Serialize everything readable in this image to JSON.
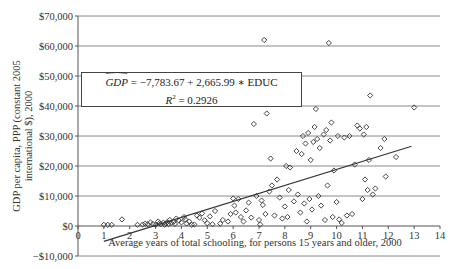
{
  "chart_data": {
    "type": "scatter",
    "title": "",
    "xlabel": "Average years of total schooling, for persons 15 years and older, 2000",
    "ylabel": "GDP per capita, PPP (constant 2005 international $), 2000",
    "xlim": [
      0,
      14
    ],
    "ylim": [
      -10000,
      70000
    ],
    "x_ticks": [
      0,
      1,
      2,
      3,
      4,
      5,
      6,
      7,
      8,
      9,
      10,
      11,
      12,
      13,
      14
    ],
    "y_ticks": [
      -10000,
      0,
      10000,
      20000,
      30000,
      40000,
      50000,
      60000,
      70000
    ],
    "y_tick_labels": [
      "−$10,000",
      "$0",
      "$10,000",
      "$20,000",
      "$30,000",
      "$40,000",
      "$50,000",
      "$60,000",
      "$70,000"
    ],
    "grid": "horizontal",
    "marker": "diamond-open",
    "regression": {
      "intercept": -7783.67,
      "slope": 2665.99,
      "variable": "EDUC",
      "r_squared": 0.2926,
      "x_range": [
        1.0,
        12.9
      ]
    },
    "annotation": {
      "lhs": "GDP",
      "equation_rhs": "= −7,783.67 + 2,665.99 ∗ EDUC",
      "r2_label": "R",
      "r2_value": "= 0.2926"
    },
    "points": [
      [
        1.0,
        400
      ],
      [
        1.15,
        400
      ],
      [
        1.3,
        400
      ],
      [
        1.7,
        2200
      ],
      [
        2.3,
        400
      ],
      [
        2.5,
        500
      ],
      [
        2.6,
        800
      ],
      [
        2.7,
        600
      ],
      [
        2.8,
        1200
      ],
      [
        2.9,
        700
      ],
      [
        3.0,
        400
      ],
      [
        3.1,
        1500
      ],
      [
        3.15,
        900
      ],
      [
        3.2,
        600
      ],
      [
        3.3,
        1100
      ],
      [
        3.35,
        400
      ],
      [
        3.4,
        800
      ],
      [
        3.45,
        1300
      ],
      [
        3.5,
        600
      ],
      [
        3.55,
        2000
      ],
      [
        3.6,
        1000
      ],
      [
        3.7,
        1400
      ],
      [
        3.75,
        700
      ],
      [
        3.8,
        2500
      ],
      [
        3.9,
        1800
      ],
      [
        4.0,
        1200
      ],
      [
        4.1,
        3000
      ],
      [
        4.15,
        2200
      ],
      [
        4.2,
        800
      ],
      [
        4.3,
        1500
      ],
      [
        4.4,
        400
      ],
      [
        4.5,
        500
      ],
      [
        4.6,
        3500
      ],
      [
        4.7,
        2800
      ],
      [
        4.8,
        4200
      ],
      [
        4.9,
        1900
      ],
      [
        5.0,
        900
      ],
      [
        5.1,
        3200
      ],
      [
        5.2,
        600
      ],
      [
        5.3,
        5000
      ],
      [
        5.5,
        800
      ],
      [
        5.6,
        2000
      ],
      [
        5.8,
        1500
      ],
      [
        5.9,
        4000
      ],
      [
        6.0,
        9200
      ],
      [
        6.05,
        6800
      ],
      [
        6.1,
        4500
      ],
      [
        6.2,
        9000
      ],
      [
        6.3,
        3000
      ],
      [
        6.4,
        1500
      ],
      [
        6.5,
        5200
      ],
      [
        6.6,
        7800
      ],
      [
        6.7,
        2800
      ],
      [
        6.8,
        34000
      ],
      [
        6.9,
        10000
      ],
      [
        7.0,
        2000
      ],
      [
        7.05,
        500
      ],
      [
        7.1,
        8500
      ],
      [
        7.15,
        7000
      ],
      [
        7.2,
        62000
      ],
      [
        7.25,
        4000
      ],
      [
        7.3,
        37500
      ],
      [
        7.4,
        11500
      ],
      [
        7.45,
        22500
      ],
      [
        7.5,
        13500
      ],
      [
        7.6,
        3500
      ],
      [
        7.7,
        15500
      ],
      [
        7.8,
        9500
      ],
      [
        7.9,
        2500
      ],
      [
        8.0,
        6500
      ],
      [
        8.05,
        20000
      ],
      [
        8.1,
        3000
      ],
      [
        8.15,
        12000
      ],
      [
        8.2,
        19500
      ],
      [
        8.3,
        48000
      ],
      [
        8.35,
        8200
      ],
      [
        8.4,
        46000
      ],
      [
        8.45,
        25000
      ],
      [
        8.5,
        10500
      ],
      [
        8.6,
        4500
      ],
      [
        8.65,
        24000
      ],
      [
        8.7,
        30000
      ],
      [
        8.75,
        7500
      ],
      [
        8.8,
        27500
      ],
      [
        8.85,
        1500
      ],
      [
        8.9,
        31000
      ],
      [
        8.95,
        9000
      ],
      [
        9.0,
        22000
      ],
      [
        9.05,
        5500
      ],
      [
        9.1,
        28000
      ],
      [
        9.15,
        33000
      ],
      [
        9.2,
        39000
      ],
      [
        9.25,
        29000
      ],
      [
        9.3,
        10000
      ],
      [
        9.35,
        26000
      ],
      [
        9.4,
        6800
      ],
      [
        9.5,
        30500
      ],
      [
        9.55,
        2000
      ],
      [
        9.6,
        32000
      ],
      [
        9.65,
        13500
      ],
      [
        9.7,
        61000
      ],
      [
        9.75,
        28500
      ],
      [
        9.8,
        34500
      ],
      [
        9.85,
        3000
      ],
      [
        9.9,
        18500
      ],
      [
        10.0,
        8000
      ],
      [
        10.05,
        30000
      ],
      [
        10.1,
        2200
      ],
      [
        10.2,
        1000
      ],
      [
        10.3,
        29500
      ],
      [
        10.4,
        3500
      ],
      [
        10.5,
        30000
      ],
      [
        10.6,
        4000
      ],
      [
        10.7,
        20500
      ],
      [
        10.8,
        33500
      ],
      [
        10.9,
        32500
      ],
      [
        11.0,
        9000
      ],
      [
        11.05,
        30500
      ],
      [
        11.1,
        15500
      ],
      [
        11.15,
        33000
      ],
      [
        11.2,
        12000
      ],
      [
        11.25,
        22000
      ],
      [
        11.3,
        43500
      ],
      [
        11.4,
        10500
      ],
      [
        11.5,
        12500
      ],
      [
        11.7,
        26000
      ],
      [
        11.85,
        29000
      ],
      [
        11.9,
        16500
      ],
      [
        12.3,
        23000
      ],
      [
        13.0,
        39500
      ]
    ]
  }
}
